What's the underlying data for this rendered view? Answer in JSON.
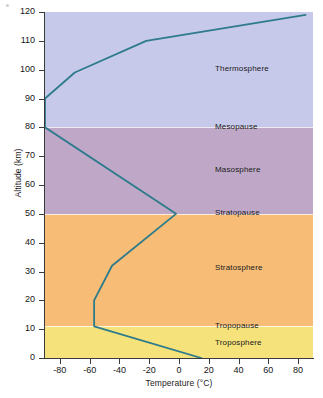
{
  "chart_data": {
    "type": "line",
    "title": "",
    "xlabel": "Temperature (°C)",
    "ylabel": "Altitude (km)",
    "xlim": [
      -90,
      90
    ],
    "ylim": [
      0,
      120
    ],
    "grid": false,
    "legend": "none",
    "orientation": "temperature-on-x-altitude-on-y",
    "xticks": [
      -80,
      -60,
      -40,
      -20,
      0,
      20,
      40,
      60,
      80
    ],
    "xtick_labels": [
      "-80",
      "-60",
      "-40",
      "-20",
      "0",
      "20",
      "40",
      "60",
      "80"
    ],
    "yticks": [
      0,
      10,
      20,
      30,
      40,
      50,
      60,
      70,
      80,
      90,
      100,
      110,
      120
    ],
    "ytick_labels": [
      "0",
      "10",
      "20",
      "30",
      "40",
      "50",
      "60",
      "70",
      "80",
      "90",
      "100",
      "110",
      "120"
    ],
    "series": [
      {
        "name": "Temperature profile",
        "color": "#2e7b8c",
        "points": [
          {
            "temperature": 15,
            "altitude": 0
          },
          {
            "temperature": -57,
            "altitude": 11
          },
          {
            "temperature": -57,
            "altitude": 20
          },
          {
            "temperature": -45,
            "altitude": 32
          },
          {
            "temperature": -2,
            "altitude": 50
          },
          {
            "temperature": -90,
            "altitude": 80
          },
          {
            "temperature": -90,
            "altitude": 90
          },
          {
            "temperature": -70,
            "altitude": 99
          },
          {
            "temperature": -22,
            "altitude": 110
          },
          {
            "temperature": 85,
            "altitude": 119
          }
        ]
      }
    ],
    "bands": [
      {
        "name": "Troposphere",
        "y0": 0,
        "y1": 11,
        "color": "#f5e27a"
      },
      {
        "name": "Stratosphere",
        "y0": 11,
        "y1": 50,
        "color": "#f7bd77"
      },
      {
        "name": "Mesosphere",
        "y0": 50,
        "y1": 80,
        "color": "#bfa8c7"
      },
      {
        "name": "Thermosphere",
        "y0": 80,
        "y1": 120,
        "color": "#c7c9ea"
      }
    ],
    "annotations": [
      {
        "label": "Thermosphere",
        "altitude": 100,
        "kind": "layer"
      },
      {
        "label": "Mesopause",
        "altitude": 80,
        "kind": "boundary"
      },
      {
        "label": "Masosphere",
        "altitude": 65,
        "kind": "layer"
      },
      {
        "label": "Stratopause",
        "altitude": 50,
        "kind": "boundary"
      },
      {
        "label": "Stratosphere",
        "altitude": 31,
        "kind": "layer"
      },
      {
        "label": "Tropopause",
        "altitude": 11,
        "kind": "boundary"
      },
      {
        "label": "Troposphere",
        "altitude": 5,
        "kind": "layer"
      }
    ]
  },
  "axes": {
    "x_title": "Temperature (°C)",
    "y_title": "Altitude (km)"
  }
}
